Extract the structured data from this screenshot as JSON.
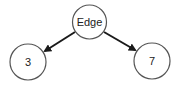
{
  "diagram": {
    "type": "tree",
    "nodes": [
      {
        "id": "root",
        "label": "Edge",
        "cx": 89.5,
        "cy": 22,
        "r": 17
      },
      {
        "id": "left",
        "label": "3",
        "cx": 28,
        "cy": 62,
        "r": 18
      },
      {
        "id": "right",
        "label": "7",
        "cx": 152,
        "cy": 61,
        "r": 18
      }
    ],
    "edges": [
      {
        "from": "root",
        "to": "left",
        "directed": true
      },
      {
        "from": "root",
        "to": "right",
        "directed": true
      }
    ],
    "colors": {
      "stroke": "#555555",
      "arrow": "#1a1a1a",
      "background": "#ffffff"
    }
  }
}
